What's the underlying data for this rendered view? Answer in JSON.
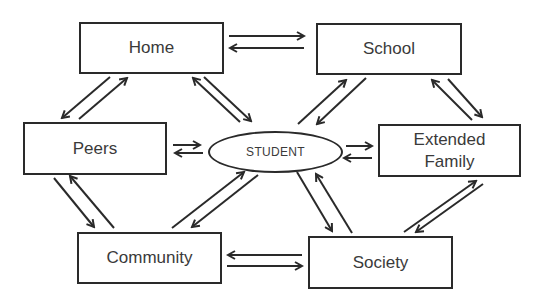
{
  "diagram": {
    "center": {
      "label": "STUDENT"
    },
    "nodes": {
      "home": {
        "label": "Home"
      },
      "school": {
        "label": "School"
      },
      "peers": {
        "label": "Peers"
      },
      "extended_family": {
        "label": "Extended Family"
      },
      "community": {
        "label": "Community"
      },
      "society": {
        "label": "Society"
      }
    },
    "edges": [
      {
        "from": "Home",
        "to": "School",
        "bidirectional": true
      },
      {
        "from": "Home",
        "to": "Peers",
        "bidirectional": true
      },
      {
        "from": "Home",
        "to": "STUDENT",
        "bidirectional": true
      },
      {
        "from": "School",
        "to": "STUDENT",
        "bidirectional": true
      },
      {
        "from": "School",
        "to": "Extended Family",
        "bidirectional": true
      },
      {
        "from": "Peers",
        "to": "STUDENT",
        "bidirectional": true
      },
      {
        "from": "STUDENT",
        "to": "Extended Family",
        "bidirectional": true
      },
      {
        "from": "Peers",
        "to": "Community",
        "bidirectional": true
      },
      {
        "from": "Community",
        "to": "STUDENT",
        "bidirectional": true
      },
      {
        "from": "STUDENT",
        "to": "Society",
        "bidirectional": true
      },
      {
        "from": "Extended Family",
        "to": "Society",
        "bidirectional": true
      },
      {
        "from": "Community",
        "to": "Society",
        "bidirectional": true
      }
    ],
    "colors": {
      "stroke": "#2a2a2a",
      "text": "#3a3a3a",
      "background": "#ffffff"
    }
  }
}
